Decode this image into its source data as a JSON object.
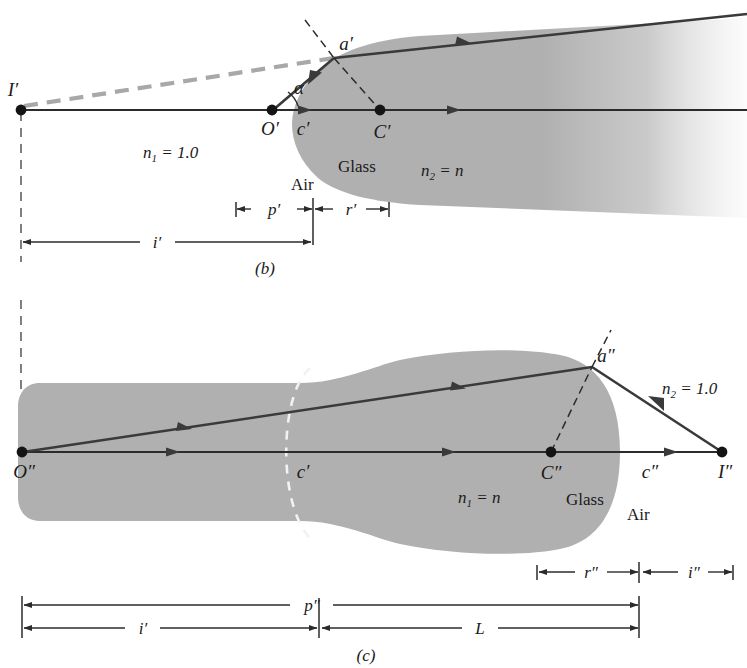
{
  "figure": {
    "background_color": "#ffffff",
    "glass_fill_color": "#b0b0b0",
    "ray_color": "#3a3a3a",
    "axis_color": "#2b2b2b",
    "dashed_gray_color": "#a8a8a8",
    "dash_black_color": "#2b2b2b",
    "white_dash_color": "#f2f2f2",
    "text_color": "#1a1a1a"
  },
  "panel_b": {
    "caption": "(b)",
    "points": [
      {
        "id": "I-prime",
        "label": "I′",
        "x": 21,
        "y": 110,
        "dot": true,
        "label_dx": -8,
        "label_dy": -14,
        "anchor": "middle"
      },
      {
        "id": "O-prime",
        "label": "O′",
        "x": 272,
        "y": 110,
        "dot": true,
        "label_dx": -2,
        "label_dy": 25,
        "anchor": "middle"
      },
      {
        "id": "a-prime",
        "label": "a′",
        "x": 334,
        "y": 58,
        "dot": false,
        "label_dx": 12,
        "label_dy": -8,
        "anchor": "middle"
      },
      {
        "id": "C-prime",
        "label": "C′",
        "x": 380,
        "y": 110,
        "dot": true,
        "label_dx": 2,
        "label_dy": 28,
        "anchor": "middle"
      },
      {
        "id": "c-prime",
        "label": "c′",
        "x": 303,
        "y": 110,
        "dot": false,
        "label_dx": 0,
        "label_dy": 25,
        "anchor": "middle"
      }
    ],
    "angle_label": "α",
    "labels": {
      "n1": "n₁ = 1.0",
      "n1_base": "n",
      "n1_sub": "1",
      "n1_rest": " = 1.0",
      "n2": "n₂ = n",
      "n2_base": "n",
      "n2_sub": "2",
      "n2_rest": " = n",
      "air": "Air",
      "glass": "Glass"
    },
    "dimensions": [
      {
        "id": "p-prime",
        "label": "p′",
        "x1": 236,
        "x2": 312,
        "y": 209
      },
      {
        "id": "r-prime",
        "label": "r′",
        "x1": 313,
        "x2": 389,
        "y": 209
      },
      {
        "id": "i-prime",
        "label": "i′",
        "x1": 21,
        "x2": 312,
        "y": 242
      }
    ]
  },
  "panel_c": {
    "caption": "(c)",
    "points": [
      {
        "id": "O-double",
        "label": "O″",
        "x": 22,
        "y": 452,
        "dot": true,
        "label_dx": 2,
        "label_dy": 26,
        "anchor": "middle"
      },
      {
        "id": "a-double",
        "label": "a″",
        "x": 592,
        "y": 367,
        "dot": false,
        "label_dx": 14,
        "label_dy": -5,
        "anchor": "middle"
      },
      {
        "id": "C-double",
        "label": "C″",
        "x": 551,
        "y": 452,
        "dot": true,
        "label_dx": 0,
        "label_dy": 27,
        "anchor": "middle"
      },
      {
        "id": "c-double",
        "label": "c″",
        "x": 650,
        "y": 452,
        "dot": false,
        "label_dx": 0,
        "label_dy": 26,
        "anchor": "middle"
      },
      {
        "id": "I-double",
        "label": "I″",
        "x": 722,
        "y": 452,
        "dot": true,
        "label_dx": 3,
        "label_dy": 26,
        "anchor": "middle"
      },
      {
        "id": "c-prime-c",
        "label": "c′",
        "x": 303,
        "y": 452,
        "dot": false,
        "label_dx": 0,
        "label_dy": 26,
        "anchor": "middle"
      }
    ],
    "labels": {
      "n1": "n₁ = n",
      "n1_base": "n",
      "n1_sub": "1",
      "n1_rest": " = n",
      "n2": "n₂ = 1.0",
      "n2_base": "n",
      "n2_sub": "2",
      "n2_rest": " = 1.0",
      "air": "Air",
      "glass": "Glass"
    },
    "dimensions": [
      {
        "id": "r-double",
        "label": "r″",
        "x1": 537,
        "x2": 639,
        "y": 572
      },
      {
        "id": "i-double",
        "label": "i″",
        "x1": 642,
        "x2": 733,
        "y": 572
      },
      {
        "id": "p-double",
        "label": "p″",
        "x1": 22,
        "x2": 639,
        "y": 605
      },
      {
        "id": "i-prime-c",
        "label": "i′",
        "x1": 22,
        "x2": 318,
        "y": 628
      },
      {
        "id": "L",
        "label": "L",
        "x1": 321,
        "x2": 639,
        "y": 628
      }
    ]
  }
}
